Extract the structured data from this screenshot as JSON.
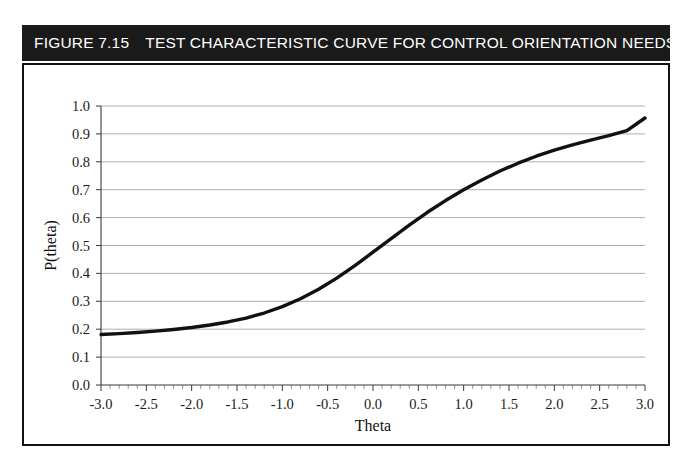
{
  "figure": {
    "number_label": "FIGURE 7.15",
    "title": "TEST CHARACTERISTIC CURVE FOR CONTROL ORIENTATION NEEDS SCALE",
    "banner_bg": "#1a1a1a",
    "banner_fg": "#ffffff",
    "frame_color": "#111111"
  },
  "chart_data": {
    "type": "line",
    "title": "TEST CHARACTERISTIC CURVE FOR CONTROL ORIENTATION NEEDS SCALE",
    "subtitle": "",
    "xlabel": "Theta",
    "ylabel": "P(theta)",
    "xlim": [
      -3.0,
      3.0
    ],
    "ylim": [
      0.0,
      1.0
    ],
    "grid": "horizontal",
    "legend": "none",
    "line_color": "#111111",
    "xticks": [
      -3.0,
      -2.5,
      -2.0,
      -1.5,
      -1.0,
      -0.5,
      0.0,
      0.5,
      1.0,
      1.5,
      2.0,
      2.5,
      3.0
    ],
    "xtick_labels": [
      "-3.0",
      "-2.5",
      "-2.0",
      "-1.5",
      "-1.0",
      "-0.5",
      "0.0",
      "0.5",
      "1.0",
      "1.5",
      "2.0",
      "2.5",
      "3.0"
    ],
    "xminor_step": 0.1,
    "yticks": [
      0.0,
      0.1,
      0.2,
      0.3,
      0.4,
      0.5,
      0.6,
      0.7,
      0.8,
      0.9,
      1.0
    ],
    "ytick_labels": [
      "0.0",
      "0.1",
      "0.2",
      "0.3",
      "0.4",
      "0.5",
      "0.6",
      "0.7",
      "0.8",
      "0.9",
      "1.0"
    ],
    "series": [
      {
        "name": "Test characteristic curve",
        "x": [
          -3.0,
          -2.8,
          -2.6,
          -2.4,
          -2.2,
          -2.0,
          -1.8,
          -1.6,
          -1.4,
          -1.2,
          -1.0,
          -0.8,
          -0.6,
          -0.4,
          -0.2,
          0.0,
          0.2,
          0.4,
          0.6,
          0.8,
          1.0,
          1.2,
          1.4,
          1.6,
          1.8,
          2.0,
          2.2,
          2.4,
          2.6,
          2.8,
          3.0
        ],
        "y": [
          0.181,
          0.184,
          0.188,
          0.193,
          0.199,
          0.206,
          0.215,
          0.226,
          0.24,
          0.258,
          0.281,
          0.309,
          0.343,
          0.383,
          0.428,
          0.476,
          0.525,
          0.573,
          0.619,
          0.661,
          0.7,
          0.735,
          0.767,
          0.795,
          0.82,
          0.842,
          0.861,
          0.878,
          0.894,
          0.912,
          0.957
        ]
      }
    ]
  }
}
